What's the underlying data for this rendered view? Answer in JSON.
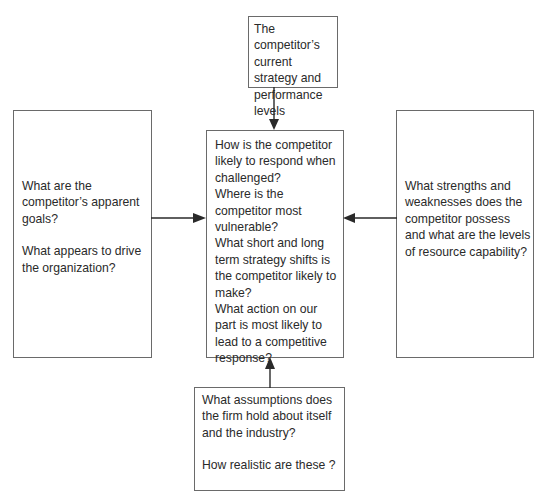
{
  "diagram": {
    "title": "",
    "boxes": {
      "top": {
        "lines": [
          "The competitor’s",
          "current strategy and",
          "performance levels"
        ]
      },
      "center": {
        "lines": [
          "How is the competitor",
          "likely to respond when",
          "challenged?",
          "Where is the",
          "competitor most",
          "vulnerable?",
          "What short and long",
          "term strategy shifts is",
          "the competitor likely to",
          "make?",
          "What action on our",
          "part is most likely to",
          "lead to a competitive",
          "response?"
        ]
      },
      "left": {
        "p1": [
          "What are the",
          "competitor’s apparent",
          "goals?"
        ],
        "p2": [
          "What appears to drive",
          "the organization?"
        ]
      },
      "right": {
        "lines": [
          "What strengths and",
          "weaknesses does the",
          "competitor possess",
          "and what are the levels",
          "of resource capability?"
        ]
      },
      "bottom": {
        "p1": [
          "What assumptions does",
          "the firm hold about itself",
          "and the industry?"
        ],
        "p2": [
          "How realistic are these ?"
        ]
      }
    },
    "arrows": [
      {
        "from": "top",
        "to": "center"
      },
      {
        "from": "left",
        "to": "center"
      },
      {
        "from": "right",
        "to": "center"
      },
      {
        "from": "bottom",
        "to": "center"
      }
    ],
    "colors": {
      "border": "#6a6a6a",
      "text": "#2a2a2a",
      "arrow": "#2a2a2a"
    }
  }
}
